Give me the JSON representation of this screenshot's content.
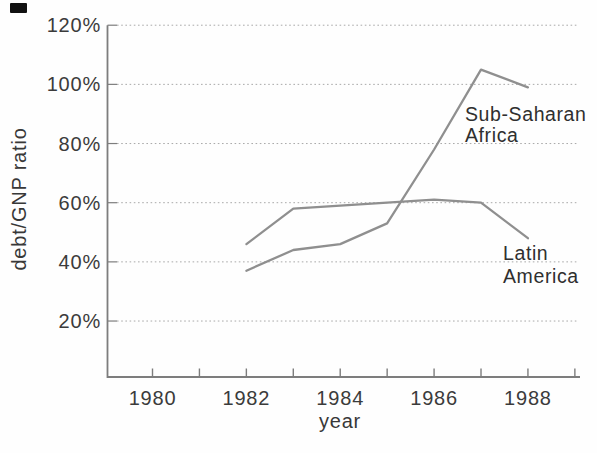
{
  "chart_data": {
    "type": "line",
    "title": "",
    "xlabel": "year",
    "ylabel": "debt/GNP ratio",
    "x": [
      1982,
      1983,
      1984,
      1985,
      1986,
      1987,
      1988
    ],
    "series": [
      {
        "name": "Sub-Saharan Africa",
        "values": [
          37,
          44,
          46,
          53,
          78,
          105,
          99
        ]
      },
      {
        "name": "Latin America",
        "values": [
          46,
          58,
          59,
          60,
          61,
          60,
          48
        ]
      }
    ],
    "x_axis": {
      "range": [
        1979,
        1989.2
      ],
      "tick_years": [
        1980,
        1981,
        1982,
        1983,
        1984,
        1985,
        1986,
        1987,
        1988,
        1989
      ],
      "major_tick_years": [
        1980,
        1982,
        1984,
        1986,
        1988
      ],
      "major_tick_labels": [
        "1980",
        "1982",
        "1984",
        "1986",
        "1988"
      ]
    },
    "y_axis": {
      "range_pct": [
        0,
        120
      ],
      "tick_values": [
        120,
        100,
        80,
        60,
        40,
        20
      ],
      "tick_labels": [
        "120%",
        "100%",
        "80%",
        "60%",
        "40%",
        "20%"
      ]
    },
    "grid": "horizontal-dotted",
    "legend_position": "inline-annotations",
    "annotations": [
      {
        "series": "Sub-Saharan Africa",
        "text_lines": [
          "Sub-Saharan",
          "Africa"
        ]
      },
      {
        "series": "Latin America",
        "text_lines": [
          "Latin",
          "America"
        ]
      }
    ],
    "colors": {
      "line": "#8f8f8f",
      "axis": "#7d7d7d",
      "grid": "#a9a9a9",
      "text": "#3b3b3b"
    }
  }
}
